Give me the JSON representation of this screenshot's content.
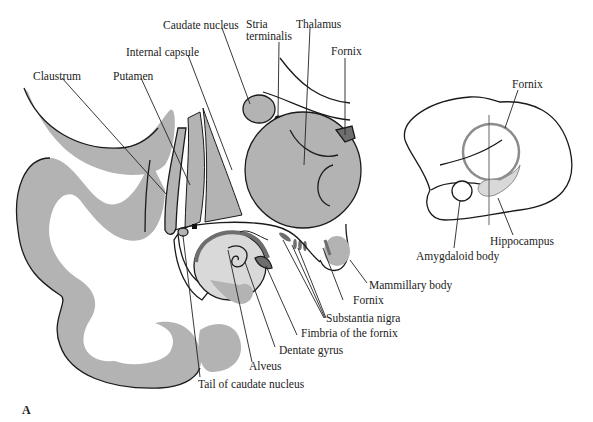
{
  "figure": {
    "panel_label": "A"
  },
  "colors": {
    "gray_matter": "#b3b3b3",
    "light_fill": "#d9d9d9",
    "dark_fill": "#6e6e6e",
    "outline": "#1a1a1a",
    "background": "#ffffff"
  },
  "main_section_labels": {
    "caudate_nucleus": "Caudate nucleus",
    "stria_terminalis_1": "Stria",
    "stria_terminalis_2": "terminalis",
    "thalamus": "Thalamus",
    "fornix_top": "Fornix",
    "internal_capsule": "Internal capsule",
    "claustrum": "Claustrum",
    "putamen": "Putamen",
    "mammillary_body": "Mammillary body",
    "fornix_bottom": "Fornix",
    "substantia_nigra": "Substantia nigra",
    "fimbria_of_the_fornix": "Fimbria of the fornix",
    "dentate_gyrus": "Dentate gyrus",
    "alveus": "Alveus",
    "tail_of_caudate_nucleus": "Tail of caudate nucleus"
  },
  "lateral_view_labels": {
    "fornix": "Fornix",
    "hippocampus": "Hippocampus",
    "amygdaloid_body": "Amygdaloid body"
  }
}
